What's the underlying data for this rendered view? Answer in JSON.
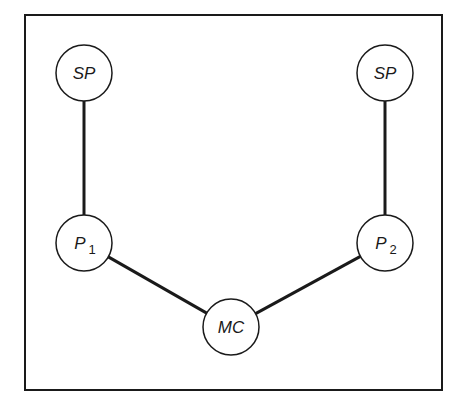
{
  "diagram": {
    "frame": {
      "x": 25,
      "y": 15,
      "width": 417,
      "height": 375,
      "stroke": "#1a1a1a"
    },
    "nodes": [
      {
        "id": "sp_left",
        "label": "SP",
        "sub": "",
        "cx": 84,
        "cy": 73,
        "r": 28
      },
      {
        "id": "sp_right",
        "label": "SP",
        "sub": "",
        "cx": 385,
        "cy": 73,
        "r": 28
      },
      {
        "id": "p1",
        "label": "P",
        "sub": "1",
        "cx": 84,
        "cy": 243,
        "r": 28
      },
      {
        "id": "p2",
        "label": "P",
        "sub": "2",
        "cx": 385,
        "cy": 243,
        "r": 28
      },
      {
        "id": "mc",
        "label": "MC",
        "sub": "",
        "cx": 231,
        "cy": 327,
        "r": 28
      }
    ],
    "edges": [
      {
        "from": "sp_left",
        "to": "p1"
      },
      {
        "from": "sp_right",
        "to": "p2"
      },
      {
        "from": "p1",
        "to": "mc"
      },
      {
        "from": "p2",
        "to": "mc"
      }
    ],
    "colors": {
      "line": "#1a1a1a",
      "node_fill": "#ffffff",
      "background": "#ffffff"
    }
  }
}
